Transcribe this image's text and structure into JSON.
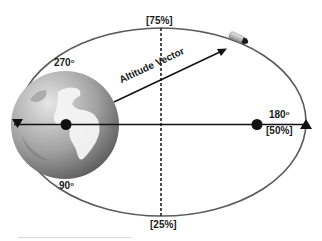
{
  "diagram": {
    "labels": {
      "top": "[75%]",
      "bottom": "[25%]",
      "right_angle": "180",
      "right_percent": "[50%]",
      "upper_left_angle": "270",
      "lower_left_angle": "90",
      "degree_mark": "o",
      "vector": "Altitude Vector"
    },
    "icons": {
      "earth": "earth-globe-icon",
      "satellite": "satellite-icon",
      "left_marker": "triangle-down-icon",
      "right_marker": "triangle-up-icon"
    },
    "colors": {
      "orbit": "#555555",
      "line": "#111111",
      "earth_light": "#d8d8d8",
      "earth_dark": "#6e6e6e",
      "background": "#ffffff"
    }
  }
}
